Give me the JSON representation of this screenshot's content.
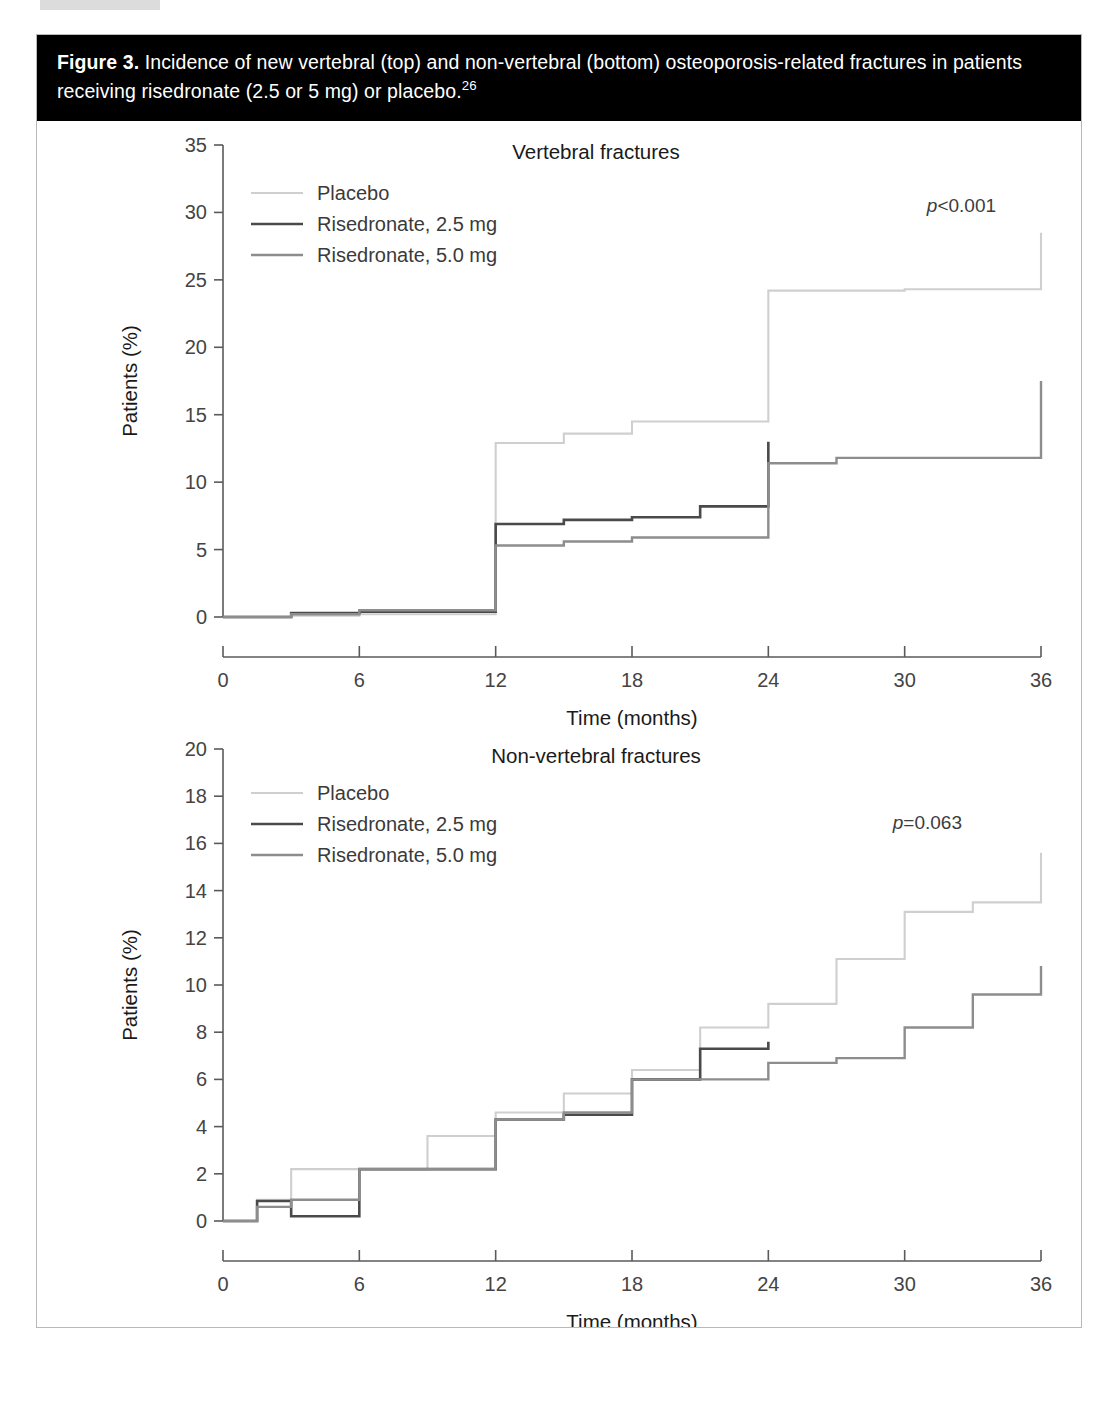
{
  "figure": {
    "label": "Figure 3.",
    "caption": " Incidence of new vertebral (top) and non-vertebral (bottom) osteoporosis-related fractures in patients receiving risedronate (2.5 or 5 mg) or placebo.",
    "reference_marker": "26"
  },
  "colors": {
    "placebo": "#cfcfcf",
    "risedronate_2_5": "#4a4a4a",
    "risedronate_5_0": "#8d8d8d",
    "caption_background": "#000000",
    "caption_text": "#ffffff",
    "axis": "#5a5a5a",
    "frame": "#b9b9b9"
  },
  "legend": {
    "items": [
      {
        "label": "Placebo",
        "key": "placebo"
      },
      {
        "label": "Risedronate, 2.5 mg",
        "key": "risedronate_2_5"
      },
      {
        "label": "Risedronate, 5.0 mg",
        "key": "risedronate_5_0"
      }
    ]
  },
  "chart_data": [
    {
      "id": "vertebral",
      "type": "line",
      "title": "Vertebral fractures",
      "xlabel": "Time (months)",
      "ylabel": "Patients (%)",
      "xlim": [
        0,
        36
      ],
      "ylim": [
        0,
        35
      ],
      "xticks": [
        0,
        6,
        12,
        18,
        24,
        30,
        36
      ],
      "yticks": [
        0,
        5,
        10,
        15,
        20,
        25,
        30,
        35
      ],
      "grid": false,
      "legend_position": "top-left",
      "annotation": {
        "text": "p<0.001",
        "italic_prefix": "p",
        "x": 32.5,
        "y": 30.0
      },
      "series": [
        {
          "name": "Placebo",
          "key": "placebo",
          "step": "post",
          "x": [
            0,
            3,
            6,
            12,
            12,
            15,
            18,
            24,
            24,
            30,
            36,
            36
          ],
          "y": [
            0.0,
            0.1,
            0.2,
            0.3,
            12.9,
            13.6,
            14.5,
            14.6,
            24.2,
            24.3,
            24.9,
            28.5
          ]
        },
        {
          "name": "Risedronate, 2.5 mg",
          "key": "risedronate_2_5",
          "step": "post",
          "x": [
            0,
            3,
            6,
            12,
            12,
            15,
            18,
            21,
            24,
            24
          ],
          "y": [
            0.0,
            0.3,
            0.4,
            0.5,
            6.9,
            7.2,
            7.4,
            8.2,
            8.3,
            13.0
          ]
        },
        {
          "name": "Risedronate, 5.0 mg",
          "key": "risedronate_5_0",
          "step": "post",
          "x": [
            0,
            3,
            6,
            12,
            12,
            15,
            18,
            24,
            24,
            27,
            36,
            36
          ],
          "y": [
            0.0,
            0.2,
            0.5,
            0.5,
            5.3,
            5.6,
            5.9,
            6.0,
            11.4,
            11.8,
            12.1,
            17.5
          ]
        }
      ]
    },
    {
      "id": "non-vertebral",
      "type": "line",
      "title": "Non-vertebral fractures",
      "xlabel": "Time (months)",
      "ylabel": "Patients (%)",
      "xlim": [
        0,
        36
      ],
      "ylim": [
        0,
        20
      ],
      "xticks": [
        0,
        6,
        12,
        18,
        24,
        30,
        36
      ],
      "yticks": [
        0,
        2,
        4,
        6,
        8,
        10,
        12,
        14,
        16,
        18,
        20
      ],
      "grid": false,
      "legend_position": "top-left",
      "annotation": {
        "text": "p=0.063",
        "italic_prefix": "p",
        "x": 31.0,
        "y": 16.6
      },
      "series": [
        {
          "name": "Placebo",
          "key": "placebo",
          "step": "post",
          "x": [
            0,
            1.5,
            3,
            6,
            9,
            12,
            15,
            18,
            21,
            24,
            27,
            30,
            33,
            36
          ],
          "y": [
            0.0,
            0.9,
            2.2,
            2.2,
            3.6,
            4.6,
            5.4,
            6.4,
            8.2,
            9.2,
            11.1,
            13.1,
            13.5,
            15.6
          ]
        },
        {
          "name": "Risedronate, 2.5 mg",
          "key": "risedronate_2_5",
          "step": "post",
          "x": [
            0,
            1.5,
            3,
            6,
            9,
            12,
            15,
            18,
            21,
            24
          ],
          "y": [
            0.0,
            0.85,
            0.2,
            2.2,
            2.2,
            4.3,
            4.5,
            6.0,
            7.3,
            7.6
          ]
        },
        {
          "name": "Risedronate, 5.0 mg",
          "key": "risedronate_5_0",
          "step": "post",
          "x": [
            0,
            1.5,
            3,
            6,
            9,
            12,
            15,
            18,
            21,
            24,
            27,
            30,
            33,
            36
          ],
          "y": [
            0.0,
            0.6,
            0.9,
            2.2,
            2.2,
            4.3,
            4.6,
            6.0,
            6.0,
            6.7,
            6.9,
            8.2,
            9.6,
            10.8
          ]
        }
      ]
    }
  ]
}
